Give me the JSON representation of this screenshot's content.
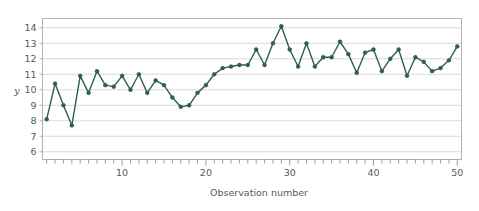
{
  "chart_data": {
    "type": "line",
    "title": "",
    "xlabel": "Observation number",
    "ylabel": "y",
    "x": [
      1,
      2,
      3,
      4,
      5,
      6,
      7,
      8,
      9,
      10,
      11,
      12,
      13,
      14,
      15,
      16,
      17,
      18,
      19,
      20,
      21,
      22,
      23,
      24,
      25,
      26,
      27,
      28,
      29,
      30,
      31,
      32,
      33,
      34,
      35,
      36,
      37,
      38,
      39,
      40,
      41,
      42,
      43,
      44,
      45,
      46,
      47,
      48,
      49,
      50
    ],
    "values": [
      8.1,
      10.4,
      9.0,
      7.7,
      10.9,
      9.8,
      11.2,
      10.3,
      10.2,
      10.9,
      10.0,
      11.0,
      9.8,
      10.6,
      10.3,
      9.5,
      8.9,
      9.0,
      9.8,
      10.3,
      11.0,
      11.4,
      11.5,
      11.6,
      11.6,
      12.6,
      11.6,
      13.0,
      14.1,
      12.6,
      11.5,
      13.0,
      11.5,
      12.1,
      12.1,
      13.1,
      12.3,
      11.1,
      12.4,
      12.6,
      11.2,
      12.0,
      12.6,
      10.9,
      12.1,
      11.8,
      11.2,
      11.4,
      11.9,
      12.8
    ],
    "series": [
      {
        "name": "y",
        "color": "#2f5d55",
        "marker": "circle",
        "values": [
          8.1,
          10.4,
          9.0,
          7.7,
          10.9,
          9.8,
          11.2,
          10.3,
          10.2,
          10.9,
          10.0,
          11.0,
          9.8,
          10.6,
          10.3,
          9.5,
          8.9,
          9.0,
          9.8,
          10.3,
          11.0,
          11.4,
          11.5,
          11.6,
          11.6,
          12.6,
          11.6,
          13.0,
          14.1,
          12.6,
          11.5,
          13.0,
          11.5,
          12.1,
          12.1,
          13.1,
          12.3,
          11.1,
          12.4,
          12.6,
          11.2,
          12.0,
          12.6,
          10.9,
          12.1,
          11.8,
          11.2,
          11.4,
          11.9,
          12.8
        ]
      }
    ],
    "xlim": [
      0.5,
      50.5
    ],
    "ylim": [
      5.5,
      14.6
    ],
    "yticks": [
      6,
      7,
      8,
      9,
      10,
      11,
      12,
      13,
      14
    ],
    "ytick_labels": [
      "6",
      "7",
      "8",
      "9",
      "10",
      "11",
      "12",
      "13",
      "14"
    ],
    "xticks_labeled": [
      10,
      20,
      30,
      40,
      50
    ],
    "xtick_labels": [
      "10",
      "20",
      "30",
      "40",
      "50"
    ],
    "xtick_minor_every": 1,
    "grid": {
      "horizontal": true,
      "vertical": false,
      "color": "#d8d8d8"
    },
    "legend": {
      "visible": false,
      "position": "none"
    },
    "plot_border_color": "#b0b0b0",
    "background": "#ffffff"
  },
  "axis": {
    "y_label": "y",
    "x_label": "Observation number"
  }
}
